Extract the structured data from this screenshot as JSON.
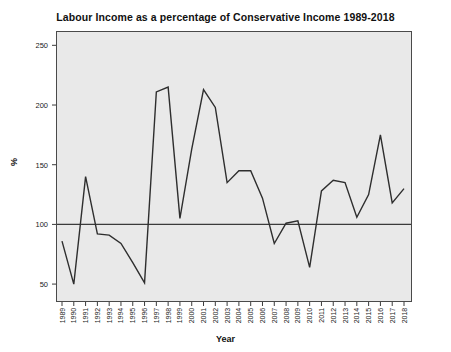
{
  "chart_data": {
    "type": "line",
    "title": "Labour Income as a percentage of Conservative Income 1989-2018",
    "xlabel": "Year",
    "ylabel": "%",
    "grid": false,
    "legend": "none",
    "xlim": [
      1989,
      2018
    ],
    "ylim": [
      35,
      262
    ],
    "yticks": [
      50,
      100,
      150,
      200,
      250
    ],
    "ytick_labels": [
      "50",
      "100",
      "150",
      "200",
      "250"
    ],
    "reference_line": {
      "value": 100,
      "orientation": "horizontal",
      "color": "#3b3b3b"
    },
    "line_color": "#2e2e2e",
    "plot_background": "#e9e9e9",
    "categories": [
      "1989",
      "1990",
      "1991",
      "1992",
      "1993",
      "1994",
      "1995",
      "1996",
      "1997",
      "1998",
      "1999",
      "2000",
      "2001",
      "2002",
      "2003",
      "2004",
      "2005",
      "2006",
      "2007",
      "2008",
      "2009",
      "2010",
      "2011",
      "2012",
      "2013",
      "2014",
      "2015",
      "2016",
      "2017",
      "2018"
    ],
    "series": [
      {
        "name": "Labour Income as % of Conservative Income",
        "values": [
          86,
          50,
          140,
          92,
          91,
          84,
          68,
          51,
          211,
          215,
          105,
          163,
          213,
          198,
          135,
          145,
          145,
          122,
          84,
          101,
          103,
          64,
          128,
          137,
          135,
          106,
          125,
          175,
          118,
          130
        ]
      }
    ]
  }
}
